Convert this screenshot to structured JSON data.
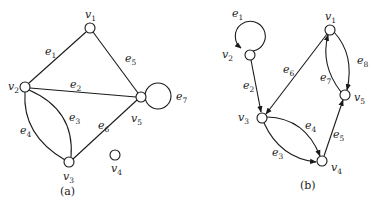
{
  "diagrams": [
    {
      "id": "a",
      "caption": "(a)",
      "type": "undirected",
      "vertices": [
        {
          "name": "v",
          "sub": "1",
          "x": 90,
          "y": 28,
          "lx": 85,
          "ly": 18
        },
        {
          "name": "v",
          "sub": "2",
          "x": 25,
          "y": 87,
          "lx": 8,
          "ly": 90
        },
        {
          "name": "v",
          "sub": "3",
          "x": 69,
          "y": 162,
          "lx": 63,
          "ly": 180
        },
        {
          "name": "v",
          "sub": "4",
          "x": 115,
          "y": 155,
          "lx": 111,
          "ly": 172
        },
        {
          "name": "v",
          "sub": "5",
          "x": 141,
          "y": 97,
          "lx": 131,
          "ly": 122
        }
      ],
      "edges": [
        {
          "name": "e",
          "sub": "1",
          "from": "v1",
          "to": "v2",
          "lx": 45,
          "ly": 55
        },
        {
          "name": "e",
          "sub": "2",
          "from": "v2",
          "to": "v5",
          "lx": 70,
          "ly": 88
        },
        {
          "name": "e",
          "sub": "3",
          "from": "v2",
          "to": "v3",
          "lx": 69,
          "ly": 121
        },
        {
          "name": "e",
          "sub": "4",
          "from": "v2",
          "to": "v3",
          "lx": 20,
          "ly": 134
        },
        {
          "name": "e",
          "sub": "5",
          "from": "v1",
          "to": "v5",
          "lx": 125,
          "ly": 62
        },
        {
          "name": "e",
          "sub": "6",
          "from": "v3",
          "to": "v5",
          "lx": 98,
          "ly": 129
        },
        {
          "name": "e",
          "sub": "7",
          "from": "v5",
          "to": "v5",
          "lx": 176,
          "ly": 100
        }
      ]
    },
    {
      "id": "b",
      "caption": "(b)",
      "type": "directed",
      "vertices": [
        {
          "name": "v",
          "sub": "1",
          "x": 330,
          "y": 30,
          "lx": 325,
          "ly": 20
        },
        {
          "name": "v",
          "sub": "2",
          "x": 250,
          "y": 55,
          "lx": 222,
          "ly": 58
        },
        {
          "name": "v",
          "sub": "3",
          "x": 262,
          "y": 118,
          "lx": 238,
          "ly": 121
        },
        {
          "name": "v",
          "sub": "4",
          "x": 322,
          "y": 161,
          "lx": 331,
          "ly": 171
        },
        {
          "name": "v",
          "sub": "5",
          "x": 345,
          "y": 95,
          "lx": 354,
          "ly": 101
        }
      ],
      "edges": [
        {
          "name": "e",
          "sub": "1",
          "from": "v2",
          "to": "v2",
          "lx": 232,
          "ly": 17
        },
        {
          "name": "e",
          "sub": "2",
          "from": "v2",
          "to": "v3",
          "lx": 243,
          "ly": 89
        },
        {
          "name": "e",
          "sub": "3",
          "from": "v3",
          "to": "v4",
          "lx": 272,
          "ly": 156
        },
        {
          "name": "e",
          "sub": "4",
          "from": "v3",
          "to": "v4",
          "lx": 305,
          "ly": 129
        },
        {
          "name": "e",
          "sub": "5",
          "from": "v4",
          "to": "v5",
          "lx": 333,
          "ly": 138
        },
        {
          "name": "e",
          "sub": "6",
          "from": "v1",
          "to": "v3",
          "lx": 283,
          "ly": 73
        },
        {
          "name": "e",
          "sub": "7",
          "from": "v5",
          "to": "v1",
          "lx": 320,
          "ly": 81
        },
        {
          "name": "e",
          "sub": "8",
          "from": "v1",
          "to": "v5",
          "lx": 357,
          "ly": 64
        }
      ]
    }
  ]
}
